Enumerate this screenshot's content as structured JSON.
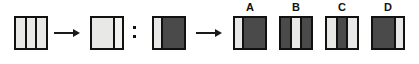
{
  "figure": {
    "type": "analogy-puzzle",
    "relation_symbol": ":",
    "arrow_symbol": "→",
    "colors": {
      "light": "#e8e8e6",
      "lighter": "#f2f2f0",
      "dark": "#4a4a4a",
      "outline": "#111111",
      "background": "#ffffff"
    }
  },
  "stimulus": {
    "term_a": {
      "name": "source-left-tile",
      "bands": [
        {
          "fill": "light",
          "width_pct": 32
        },
        {
          "fill": "light",
          "width_pct": 30
        },
        {
          "fill": "light",
          "width_pct": 32
        }
      ],
      "dividers": 2
    },
    "term_b": {
      "name": "source-right-tile",
      "bands": [
        {
          "fill": "light",
          "width_pct": 73
        },
        {
          "fill": "lighter",
          "width_pct": 25
        }
      ],
      "dividers": 1
    },
    "term_c": {
      "name": "target-left-tile",
      "bands": [
        {
          "fill": "light",
          "width_pct": 25
        },
        {
          "fill": "dark",
          "width_pct": 73
        }
      ],
      "dividers": 1
    }
  },
  "options": [
    {
      "label": "A",
      "name": "option-a",
      "bands": [
        {
          "fill": "light",
          "width_pct": 26
        },
        {
          "fill": "dark",
          "width_pct": 72
        }
      ],
      "dividers": 1
    },
    {
      "label": "B",
      "name": "option-b",
      "bands": [
        {
          "fill": "dark",
          "width_pct": 33
        },
        {
          "fill": "light",
          "width_pct": 30
        },
        {
          "fill": "dark",
          "width_pct": 33
        }
      ],
      "dividers": 2
    },
    {
      "label": "C",
      "name": "option-c",
      "bands": [
        {
          "fill": "light",
          "width_pct": 33
        },
        {
          "fill": "dark",
          "width_pct": 30
        },
        {
          "fill": "light",
          "width_pct": 33
        }
      ],
      "dividers": 2
    },
    {
      "label": "D",
      "name": "option-d",
      "bands": [
        {
          "fill": "dark",
          "width_pct": 72
        },
        {
          "fill": "light",
          "width_pct": 26
        }
      ],
      "dividers": 1
    }
  ],
  "layout": {
    "tile_size": 34,
    "tile_top": 16,
    "label_top": 2,
    "positions": {
      "term_a_x": 14,
      "arrow1_x": 54,
      "arrow1_w": 26,
      "term_b_x": 90,
      "colon_x": 133,
      "colon_y": 26,
      "term_c_x": 152,
      "arrow2_x": 196,
      "arrow2_w": 26,
      "option_x": [
        233,
        279,
        325,
        371
      ]
    }
  }
}
